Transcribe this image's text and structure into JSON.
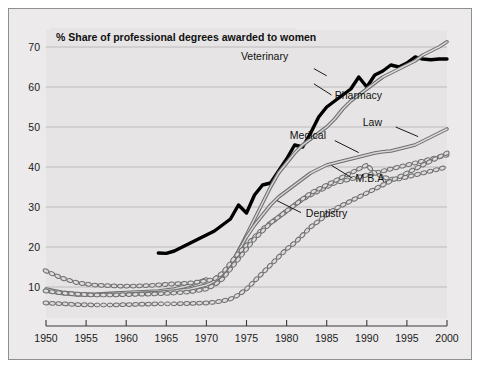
{
  "figure": {
    "background_color": "#ffffff",
    "panel_color": "#eceaea",
    "border_color": "#8f8f8f"
  },
  "chart_data": {
    "type": "line",
    "title": "% Share of professional degrees awarded to women",
    "xlabel": "",
    "ylabel": "",
    "xlim": [
      1950,
      2000
    ],
    "ylim": [
      0,
      73
    ],
    "grid": true,
    "grid_axis": "y",
    "legend_position": "inline-annotations",
    "xticks": [
      1950,
      1955,
      1960,
      1965,
      1970,
      1975,
      1980,
      1985,
      1990,
      1995,
      2000
    ],
    "xticklabels": [
      "1950",
      "1955",
      "1960",
      "1965",
      "1970",
      "1975",
      "1980",
      "1985",
      "1990",
      "1995",
      "2000"
    ],
    "yticks": [
      10,
      20,
      30,
      40,
      50,
      60,
      70
    ],
    "yticklabels": [
      "10",
      "20",
      "30",
      "40",
      "50",
      "60",
      "70"
    ],
    "series": [
      {
        "name": "Veterinary",
        "style": "solid-thick",
        "color": "#000000",
        "label_x": 1982.0,
        "label_y": 65.5,
        "x": [
          1964,
          1965,
          1966,
          1967,
          1968,
          1969,
          1970,
          1971,
          1972,
          1973,
          1974,
          1975,
          1976,
          1977,
          1978,
          1979,
          1980,
          1981,
          1982,
          1983,
          1984,
          1985,
          1986,
          1987,
          1988,
          1989,
          1990,
          1991,
          1992,
          1993,
          1994,
          1995,
          1996,
          1997,
          1998,
          1999,
          2000
        ],
        "y": [
          18.5,
          18.4,
          19.0,
          20.0,
          21.0,
          22.0,
          23.0,
          24.0,
          25.5,
          27.0,
          30.5,
          28.5,
          33.0,
          35.5,
          36.0,
          39.0,
          42.0,
          45.5,
          45.0,
          48.5,
          52.5,
          55.0,
          56.5,
          58.0,
          59.5,
          62.5,
          60.0,
          63.0,
          64.0,
          65.5,
          65.0,
          66.0,
          67.5,
          67.0,
          66.8,
          67.0,
          67.0
        ]
      },
      {
        "name": "Pharmacy",
        "style": "solid-outlined",
        "color": "#8d8d8d",
        "label_x": 1987.5,
        "label_y": 57.5,
        "x": [
          1950,
          1952,
          1954,
          1956,
          1958,
          1960,
          1962,
          1964,
          1966,
          1968,
          1970,
          1971,
          1972,
          1973,
          1974,
          1975,
          1976,
          1977,
          1978,
          1979,
          1980,
          1981,
          1982,
          1983,
          1984,
          1985,
          1986,
          1987,
          1988,
          1989,
          1990,
          1991,
          1992,
          1993,
          1994,
          1995,
          1996,
          1997,
          1998,
          1999,
          2000
        ],
        "y": [
          9.5,
          8.7,
          8.3,
          8.2,
          8.4,
          8.6,
          8.8,
          9.0,
          9.5,
          10.5,
          12.0,
          11.0,
          12.5,
          15.0,
          19.0,
          23.0,
          27.0,
          31.0,
          35.0,
          38.5,
          41.0,
          43.5,
          45.5,
          47.0,
          48.5,
          50.0,
          52.0,
          54.5,
          56.5,
          58.0,
          59.5,
          61.0,
          62.5,
          63.5,
          64.5,
          65.5,
          66.5,
          68.0,
          69.0,
          70.0,
          71.3
        ]
      },
      {
        "name": "Law",
        "style": "solid-outlined",
        "color": "#8d8d8d",
        "label_x": 1990.5,
        "label_y": 50.5,
        "x": [
          1950,
          1952,
          1954,
          1956,
          1958,
          1960,
          1962,
          1964,
          1966,
          1968,
          1970,
          1971,
          1972,
          1973,
          1974,
          1975,
          1976,
          1977,
          1978,
          1979,
          1980,
          1981,
          1982,
          1983,
          1984,
          1985,
          1986,
          1987,
          1988,
          1989,
          1990,
          1991,
          1992,
          1993,
          1994,
          1995,
          1996,
          1997,
          1998,
          1999,
          2000
        ],
        "y": [
          9.0,
          8.4,
          8.0,
          8.0,
          8.1,
          8.2,
          8.4,
          8.6,
          9.0,
          9.5,
          10.5,
          11.5,
          13.0,
          15.5,
          19.0,
          22.5,
          25.5,
          28.0,
          30.5,
          32.5,
          34.0,
          35.5,
          37.0,
          38.5,
          39.5,
          40.5,
          41.0,
          41.5,
          42.0,
          42.5,
          43.0,
          43.5,
          43.8,
          44.0,
          44.5,
          45.0,
          45.5,
          46.5,
          47.5,
          48.5,
          49.5
        ]
      },
      {
        "name": "Medical",
        "style": "dashed-oval",
        "color": "#8d8d8d",
        "label_x": 1983.0,
        "label_y": 47.5,
        "x": [
          1950,
          1952,
          1954,
          1956,
          1958,
          1960,
          1962,
          1964,
          1966,
          1968,
          1970,
          1971,
          1972,
          1973,
          1974,
          1975,
          1976,
          1977,
          1978,
          1979,
          1980,
          1981,
          1982,
          1983,
          1984,
          1985,
          1986,
          1987,
          1988,
          1989,
          1990,
          1991,
          1992,
          1993,
          1994,
          1995,
          1996,
          1997,
          1998,
          1999,
          2000
        ],
        "y": [
          14.0,
          12.2,
          11.0,
          10.5,
          10.3,
          10.2,
          10.3,
          10.5,
          10.8,
          11.0,
          11.5,
          12.0,
          13.5,
          16.0,
          18.5,
          20.5,
          22.5,
          24.5,
          26.0,
          27.5,
          29.0,
          30.5,
          32.0,
          33.0,
          34.0,
          35.0,
          36.0,
          36.5,
          37.0,
          37.5,
          38.0,
          38.5,
          39.0,
          39.5,
          40.0,
          40.5,
          41.0,
          41.5,
          42.0,
          42.5,
          43.0
        ]
      },
      {
        "name": "M.B.A.",
        "style": "dashed-oval",
        "color": "#8d8d8d",
        "label_x": 1990.0,
        "label_y": 37.0,
        "x": [
          1950,
          1952,
          1954,
          1956,
          1958,
          1960,
          1962,
          1964,
          1966,
          1968,
          1970,
          1971,
          1972,
          1973,
          1974,
          1975,
          1976,
          1977,
          1978,
          1979,
          1980,
          1981,
          1982,
          1983,
          1984,
          1985,
          1986,
          1987,
          1988,
          1989,
          1990,
          1991,
          1992,
          1993,
          1994,
          1995,
          1996,
          1997,
          1998,
          1999,
          2000
        ],
        "y": [
          9.0,
          8.5,
          8.2,
          8.0,
          8.0,
          8.1,
          8.2,
          8.3,
          8.5,
          8.8,
          9.5,
          10.5,
          12.0,
          14.5,
          17.0,
          19.5,
          22.0,
          24.0,
          26.0,
          27.5,
          29.0,
          30.5,
          32.0,
          33.5,
          34.5,
          35.5,
          36.5,
          37.5,
          38.5,
          39.5,
          40.5,
          38.5,
          37.5,
          37.0,
          37.0,
          37.5,
          38.0,
          38.5,
          39.0,
          39.5,
          40.0
        ]
      },
      {
        "name": "Dentistry",
        "style": "dashed-oval",
        "color": "#8d8d8d",
        "label_x": 1983.5,
        "label_y": 28.0,
        "x": [
          1950,
          1952,
          1954,
          1956,
          1958,
          1960,
          1962,
          1964,
          1966,
          1968,
          1970,
          1971,
          1972,
          1973,
          1974,
          1975,
          1976,
          1977,
          1978,
          1979,
          1980,
          1981,
          1982,
          1983,
          1984,
          1985,
          1986,
          1987,
          1988,
          1989,
          1990,
          1991,
          1992,
          1993,
          1994,
          1995,
          1996,
          1997,
          1998,
          1999,
          2000
        ],
        "y": [
          6.0,
          5.8,
          5.6,
          5.5,
          5.5,
          5.6,
          5.7,
          5.8,
          5.8,
          5.9,
          6.0,
          6.2,
          6.5,
          7.0,
          8.0,
          9.5,
          11.5,
          13.5,
          15.5,
          17.5,
          19.5,
          21.0,
          23.0,
          25.0,
          26.5,
          28.0,
          29.5,
          30.5,
          31.5,
          32.5,
          33.5,
          34.5,
          35.5,
          36.5,
          37.5,
          38.5,
          39.5,
          40.5,
          41.5,
          42.5,
          43.5
        ]
      }
    ]
  }
}
